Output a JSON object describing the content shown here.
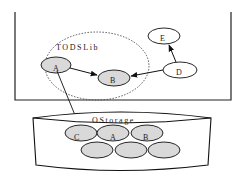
{
  "diagram": {
    "library": {
      "label": "TODSLib",
      "nodes": [
        {
          "id": "A",
          "label": "A",
          "shaded": true
        },
        {
          "id": "B",
          "label": "B",
          "shaded": true
        }
      ]
    },
    "external_nodes": [
      {
        "id": "D",
        "label": "D",
        "shaded": false
      },
      {
        "id": "E",
        "label": "E",
        "shaded": false
      }
    ],
    "storage": {
      "label": "OStorage",
      "slots": [
        {
          "label": "C"
        },
        {
          "label": "A"
        },
        {
          "label": "B"
        },
        {
          "label": ""
        },
        {
          "label": ""
        },
        {
          "label": ""
        }
      ]
    },
    "edges": [
      {
        "from": "A",
        "to": "B"
      },
      {
        "from": "D",
        "to": "B"
      },
      {
        "from": "D",
        "to": "E"
      },
      {
        "from": "A",
        "to": "OStorage.C"
      }
    ],
    "colors": {
      "node_fill": "#d9d9d9",
      "stroke": "#111111",
      "background": "#ffffff"
    }
  }
}
